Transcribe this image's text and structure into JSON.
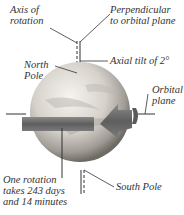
{
  "labels": {
    "axis_of_rotation": [
      "Axis of",
      "rotation"
    ],
    "perpendicular": [
      "Perpendicular",
      "to orbital plane"
    ],
    "axial_tilt": "Axial tilt of  2°",
    "north_pole": [
      "North",
      "Pole"
    ],
    "orbital_plane": [
      "Orbital",
      "plane"
    ],
    "one_rotation": [
      "One rotation",
      "takes 243 days",
      "and 14 minutes"
    ],
    "south_pole": "South Pole"
  },
  "colors": {
    "planet_light": "#f2f0ec",
    "planet_mid": "#c8c4bd",
    "planet_dark": "#7a7670",
    "arrow": "#6a6a6a",
    "line": "#333333"
  }
}
